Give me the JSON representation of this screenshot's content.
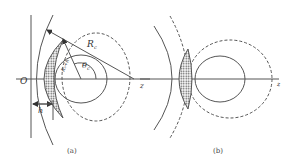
{
  "panels": [
    {
      "caption": "(a)",
      "labels": {
        "origin": "O",
        "axis": "z",
        "radius": "R",
        "radius_sub": "c",
        "angle": "θ",
        "angle_sub": "c",
        "inner_radius": "Rₑ+h",
        "height": "h"
      }
    },
    {
      "caption": "(b)",
      "labels": {
        "axis": "z"
      }
    }
  ],
  "colors": {
    "line": "#555555",
    "hatch": "#666666"
  }
}
